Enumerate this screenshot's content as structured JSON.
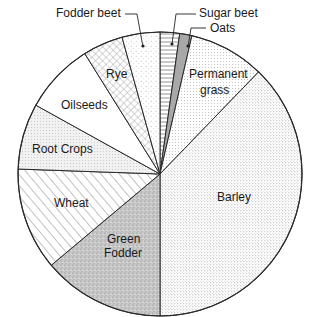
{
  "chart_data": {
    "type": "pie",
    "title": "",
    "start_angle_deg": 0,
    "direction": "clockwise",
    "slices": [
      {
        "key": "sugar_beet",
        "label": "Sugar beet",
        "value": 2.2,
        "start": 0,
        "end": 8,
        "pattern": "hlines",
        "label_external": true
      },
      {
        "key": "oats",
        "label": "Oats",
        "value": 1.4,
        "start": 8,
        "end": 13,
        "pattern": "solidgray",
        "label_external": true
      },
      {
        "key": "permanent_grass",
        "label": "Permanent grass",
        "value": 8.6,
        "start": 13,
        "end": 44,
        "pattern": "finedots",
        "label_external": false
      },
      {
        "key": "barley",
        "label": "Barley",
        "value": 37.8,
        "start": 44,
        "end": 180,
        "pattern": "dots",
        "label_external": false
      },
      {
        "key": "green_fodder",
        "label": "Green Fodder",
        "value": 13.9,
        "start": 180,
        "end": 230,
        "pattern": "densespeckle",
        "label_external": false
      },
      {
        "key": "wheat",
        "label": "Wheat",
        "value": 11.7,
        "start": 230,
        "end": 272,
        "pattern": "diagonal",
        "label_external": false
      },
      {
        "key": "root_crops",
        "label": "Root Crops",
        "value": 7.5,
        "start": 272,
        "end": 299,
        "pattern": "lightspeckle",
        "label_external": false
      },
      {
        "key": "oilseeds",
        "label": "Oilseeds",
        "value": 8.1,
        "start": 299,
        "end": 328,
        "pattern": "none",
        "label_external": false
      },
      {
        "key": "rye",
        "label": "Rye",
        "value": 4.6,
        "start": 328,
        "end": 344.5,
        "pattern": "crosshatch",
        "label_external": false
      },
      {
        "key": "fodder_beet",
        "label": "Fodder beet",
        "value": 4.3,
        "start": 344.5,
        "end": 360,
        "pattern": "sparsedots",
        "label_external": true
      }
    ],
    "legend": "none (labels placed on/around slices)",
    "units": "percent of land area (estimated from slice angles)"
  },
  "labels": {
    "fodder_beet": "Fodder beet",
    "sugar_beet": "Sugar beet",
    "oats": "Oats",
    "permanent_grass_1": "Permanent",
    "permanent_grass_2": "grass",
    "rye": "Rye",
    "oilseeds": "Oilseeds",
    "root_crops": "Root Crops",
    "wheat": "Wheat",
    "green_fodder_1": "Green",
    "green_fodder_2": "Fodder",
    "barley": "Barley"
  },
  "colors": {
    "outline": "#2a2a2a",
    "background": "#ffffff",
    "oats_fill": "#a8a8a8",
    "green_fodder_fill": "#c4c4c4"
  }
}
